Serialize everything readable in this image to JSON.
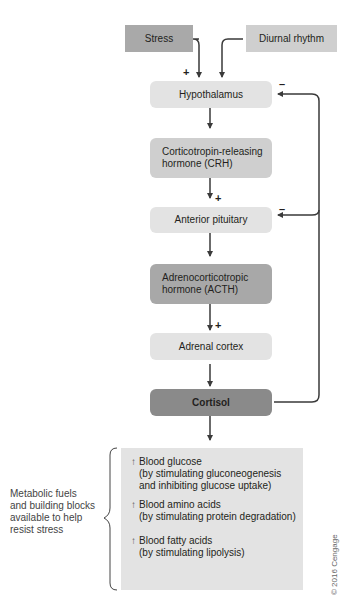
{
  "diagram": {
    "inputs": {
      "stress": "Stress",
      "diurnal": "Diurnal rhythm"
    },
    "nodes": {
      "hypothalamus": "Hypothalamus",
      "crh_line1": "Corticotropin-releasing",
      "crh_line2": "hormone (CRH)",
      "anterior_pituitary": "Anterior pituitary",
      "acth_line1": "Adrenocorticotropic",
      "acth_line2": "hormone (ACTH)",
      "adrenal_cortex": "Adrenal cortex",
      "cortisol": "Cortisol"
    },
    "signs": {
      "stimulate": "+",
      "inhibit": "–"
    },
    "effects": [
      {
        "arrow": "↑",
        "title": "Blood glucose",
        "detail1": "(by stimulating gluconeogenesis",
        "detail2": "and inhibiting glucose uptake)"
      },
      {
        "arrow": "↑",
        "title": "Blood amino acids",
        "detail1": "(by stimulating protein degradation)",
        "detail2": ""
      },
      {
        "arrow": "↑",
        "title": "Blood fatty acids",
        "detail1": "(by stimulating lipolysis)",
        "detail2": ""
      }
    ],
    "caption": {
      "line1": "Metabolic fuels",
      "line2": "and building blocks",
      "line3": "available to help",
      "line4": "resist stress"
    },
    "copyright": "© 2016 Cengage"
  }
}
